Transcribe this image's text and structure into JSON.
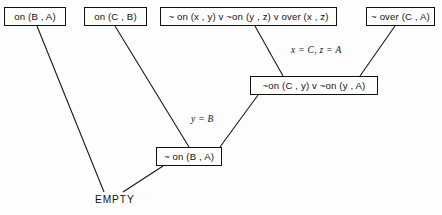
{
  "diagram": {
    "background_color": "#fdfdfd",
    "line_color": "#111111",
    "nodes": [
      {
        "id": "n1",
        "label": "on (B , A)",
        "x": 4,
        "y": 7,
        "w": 62,
        "h": 19
      },
      {
        "id": "n2",
        "label": "on (C , B)",
        "x": 84,
        "y": 7,
        "w": 63,
        "h": 19
      },
      {
        "id": "n3",
        "label": "~ on (x , y) v ~on (y , z) v over (x , z)",
        "x": 160,
        "y": 7,
        "w": 177,
        "h": 19
      },
      {
        "id": "n4",
        "label": "~ over (C , A)",
        "x": 366,
        "y": 7,
        "w": 69,
        "h": 19
      },
      {
        "id": "n5",
        "label": "~on (C , y) v ~on (y , A)",
        "x": 250,
        "y": 76,
        "w": 128,
        "h": 19
      },
      {
        "id": "n6",
        "label": "~ on (B , A)",
        "x": 156,
        "y": 147,
        "w": 66,
        "h": 19
      }
    ],
    "empty_node": {
      "id": "n7",
      "label": "EMPTY",
      "x": 95,
      "y": 194
    },
    "substitutions": [
      {
        "id": "s1",
        "label": "x = C, z = A",
        "x": 291,
        "y": 45
      },
      {
        "id": "s2",
        "label": "y = B",
        "x": 191,
        "y": 114
      }
    ],
    "edges": [
      {
        "id": "e1",
        "from": "n3",
        "to": "n5",
        "x1": 255,
        "y1": 26,
        "x2": 283,
        "y2": 76
      },
      {
        "id": "e2",
        "from": "n4",
        "to": "n5",
        "x1": 395,
        "y1": 26,
        "x2": 360,
        "y2": 76
      },
      {
        "id": "e3",
        "from": "n5",
        "to": "n6",
        "x1": 258,
        "y1": 95,
        "x2": 220,
        "y2": 147
      },
      {
        "id": "e4",
        "from": "n2",
        "to": "n6",
        "x1": 115,
        "y1": 26,
        "x2": 189,
        "y2": 147
      },
      {
        "id": "e5",
        "from": "n6",
        "to": "n7",
        "x1": 163,
        "y1": 166,
        "x2": 123,
        "y2": 192
      },
      {
        "id": "e6",
        "from": "n1",
        "to": "n7",
        "x1": 37,
        "y1": 26,
        "x2": 104,
        "y2": 192
      }
    ]
  }
}
